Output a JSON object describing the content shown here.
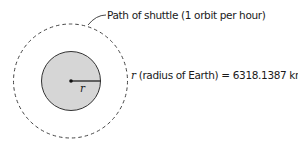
{
  "diagram": {
    "orbit_label": "Path of shuttle (1 orbit per hour)",
    "radius_label_var": "r",
    "radius_label_text": " (radius of Earth) = 6318.1387 km",
    "radius_marker": "r",
    "colors": {
      "earth_fill": "#d6d6d6",
      "stroke": "#333333",
      "text": "#1a1a1a"
    }
  }
}
